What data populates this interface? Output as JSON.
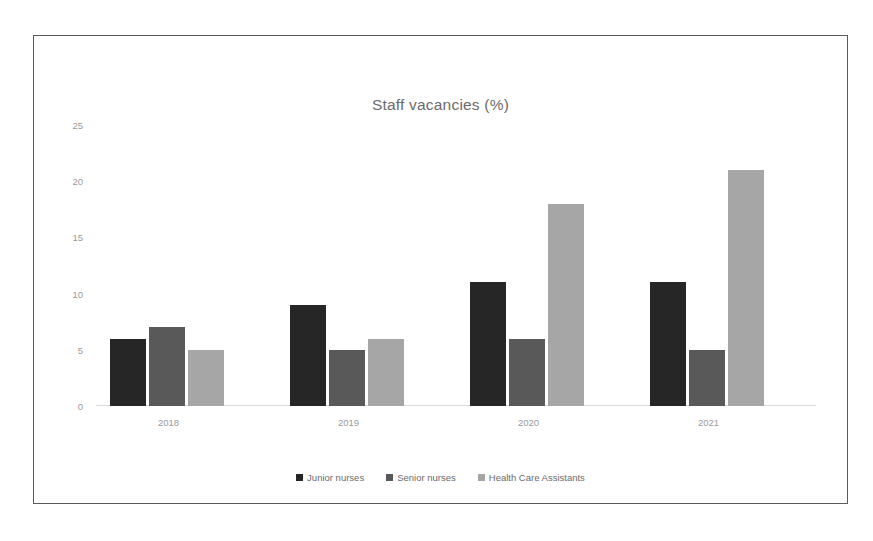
{
  "chart_data": {
    "type": "bar",
    "title": "Staff vacancies (%)",
    "xlabel": "",
    "ylabel": "",
    "categories": [
      "2018",
      "2019",
      "2020",
      "2021"
    ],
    "series": [
      {
        "name": "Junior nurses",
        "color": "#262626",
        "values": [
          6,
          9,
          11,
          11
        ]
      },
      {
        "name": "Senior nurses",
        "color": "#595959",
        "values": [
          7,
          5,
          6,
          5
        ]
      },
      {
        "name": "Health Care Assistants",
        "color": "#a6a6a6",
        "values": [
          5,
          6,
          18,
          21
        ]
      }
    ],
    "ylim": [
      0,
      25
    ],
    "ytick_labels": [
      "25",
      "20",
      "15",
      "10",
      "5",
      "0"
    ],
    "ytick_values": [
      25,
      20,
      15,
      10,
      5,
      0
    ],
    "grid": false,
    "legend_position": "bottom"
  }
}
